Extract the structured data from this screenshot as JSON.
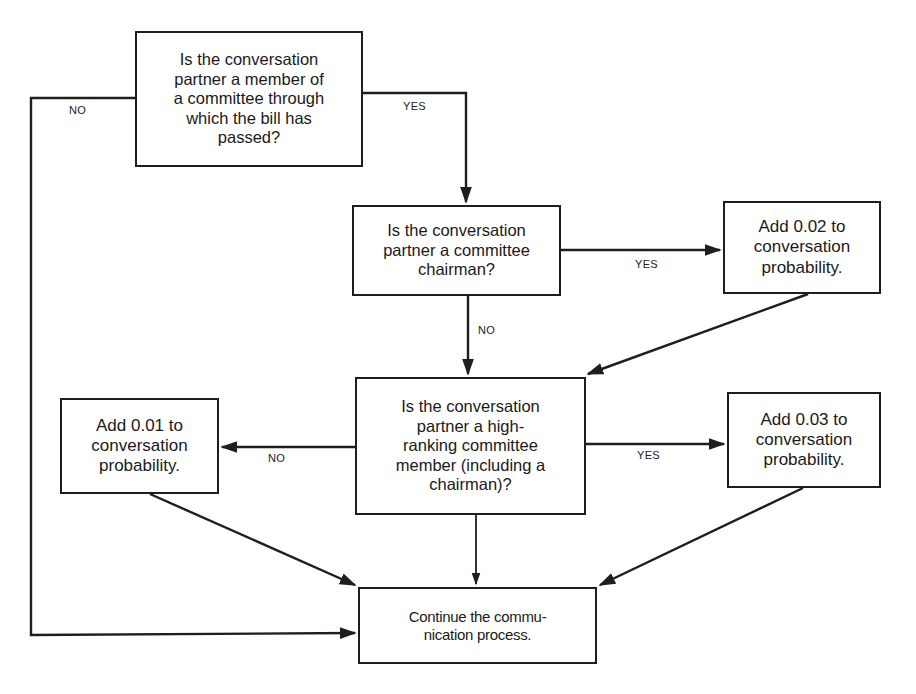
{
  "diagram": {
    "type": "flowchart",
    "nodes": [
      {
        "id": "q_committee_member",
        "kind": "decision",
        "text": "Is the conversation\npartner a member of\na committee through\nwhich the bill has\npassed?"
      },
      {
        "id": "q_chairman",
        "kind": "decision",
        "text": "Is the conversation\npartner a committee\nchairman?"
      },
      {
        "id": "add_002",
        "kind": "action",
        "text": "Add 0.02 to\nconversation\nprobability."
      },
      {
        "id": "q_high_ranking",
        "kind": "decision",
        "text": "Is the conversation\npartner a high-\nranking committee\nmember (including a\nchairman)?"
      },
      {
        "id": "add_001",
        "kind": "action",
        "text": "Add 0.01 to\nconversation\nprobability."
      },
      {
        "id": "add_003",
        "kind": "action",
        "text": "Add 0.03 to\nconversation\nprobability."
      },
      {
        "id": "continue",
        "kind": "terminal",
        "text": "Continue the commu-\nnication process."
      }
    ],
    "edges": [
      {
        "from": "q_committee_member",
        "to": "continue",
        "label": "NO"
      },
      {
        "from": "q_committee_member",
        "to": "q_chairman",
        "label": "YES"
      },
      {
        "from": "q_chairman",
        "to": "add_002",
        "label": "YES"
      },
      {
        "from": "q_chairman",
        "to": "q_high_ranking",
        "label": "NO"
      },
      {
        "from": "add_002",
        "to": "q_high_ranking",
        "label": ""
      },
      {
        "from": "q_high_ranking",
        "to": "add_001",
        "label": "NO"
      },
      {
        "from": "q_high_ranking",
        "to": "add_003",
        "label": "YES"
      },
      {
        "from": "q_high_ranking",
        "to": "continue",
        "label": ""
      },
      {
        "from": "add_001",
        "to": "continue",
        "label": ""
      },
      {
        "from": "add_003",
        "to": "continue",
        "label": ""
      }
    ],
    "labels": {
      "top_no": "NO",
      "top_yes": "YES",
      "chairman_yes": "YES",
      "chairman_no": "NO",
      "high_rank_no": "NO",
      "high_rank_yes": "YES"
    }
  }
}
